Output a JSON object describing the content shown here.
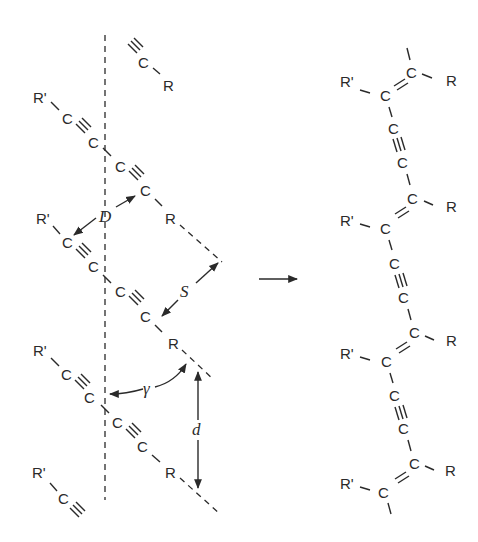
{
  "diagram": {
    "colors": {
      "ink": "#2a2a2a",
      "background": "#ffffff"
    },
    "monomer_stack": {
      "labels": {
        "r": "R",
        "r_prime": "R'",
        "c": "C"
      },
      "parameters": {
        "D": "D",
        "S": "S",
        "gamma": "γ",
        "d": "d"
      }
    },
    "reaction_arrow": "reaction-arrow",
    "polymer": {
      "labels": {
        "r": "R",
        "r_prime": "R'",
        "c": "C"
      }
    }
  }
}
